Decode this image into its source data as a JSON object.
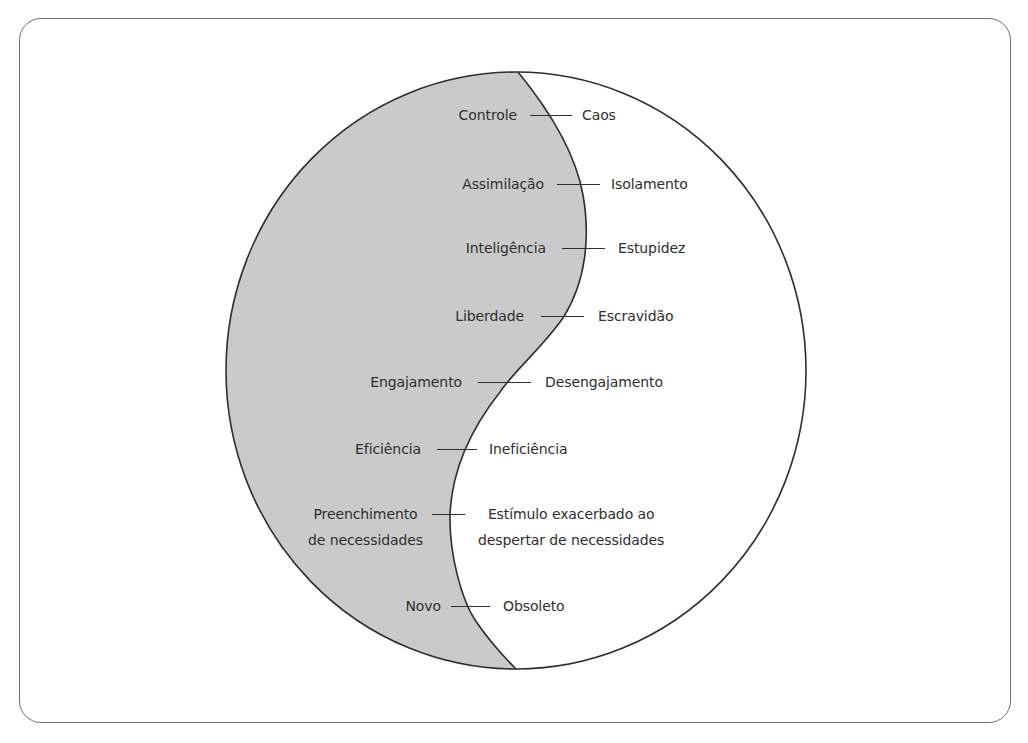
{
  "diagram": {
    "type": "yin-yang-duality",
    "colors": {
      "left_fill": "#cacaca",
      "right_fill": "#ffffff",
      "stroke": "#2e2e2e",
      "frame": "#6f6f6f",
      "text": "#2e2e2e"
    },
    "pairs": [
      {
        "left": "Controle",
        "right": "Caos"
      },
      {
        "left": "Assimilação",
        "right": "Isolamento"
      },
      {
        "left": "Inteligência",
        "right": "Estupidez"
      },
      {
        "left": "Liberdade",
        "right": "Escravidão"
      },
      {
        "left": "Engajamento",
        "right": "Desengajamento"
      },
      {
        "left": "Eficiência",
        "right": "Ineficiência"
      },
      {
        "left": "Preenchimento\nde necessidades",
        "right": "Estímulo exacerbado ao\ndespertar de necessidades"
      },
      {
        "left": "Novo",
        "right": "Obsoleto"
      }
    ]
  }
}
